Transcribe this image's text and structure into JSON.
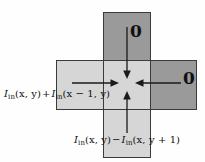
{
  "figure": {
    "name": "flux-cross-diagram",
    "background_color": "#fefefe",
    "cell_dark_color": "#9a9a9a",
    "cell_light_color": "#d6d6d6",
    "cell_border_color": "#3a3a3a",
    "arrow_color": "#1a1a1a"
  },
  "cells": [
    {
      "id": "top",
      "shade": "dark",
      "position": "top"
    },
    {
      "id": "left",
      "shade": "light",
      "position": "left"
    },
    {
      "id": "center",
      "shade": "light",
      "position": "center"
    },
    {
      "id": "right",
      "shade": "dark",
      "position": "right"
    },
    {
      "id": "bottom",
      "shade": "light",
      "position": "bottom"
    }
  ],
  "arrows": [
    {
      "id": "from-top",
      "direction": "down",
      "label_ref": "zero_top"
    },
    {
      "id": "from-left",
      "direction": "right",
      "label_ref": "horizontal"
    },
    {
      "id": "from-right",
      "direction": "left",
      "label_ref": "zero_right"
    },
    {
      "id": "from-bottom",
      "direction": "up",
      "label_ref": "vertical"
    }
  ],
  "labels": {
    "zero_top": "0",
    "zero_right": "0",
    "horizontal": {
      "term1_var": "I",
      "term1_sub": "in",
      "term1_args": "(x, y)",
      "operator": "+",
      "term2_var": "I",
      "term2_sub": "in",
      "term2_args": "(x − 1, y)",
      "full": "I_in(x, y) + I_in(x − 1, y)"
    },
    "vertical": {
      "term1_var": "I",
      "term1_sub": "in",
      "term1_args": "(x, y)",
      "operator": "−",
      "term2_var": "I",
      "term2_sub": "in",
      "term2_args": "(x, y + 1)",
      "full": "I_in(x, y) − I_in(x, y + 1)"
    }
  }
}
